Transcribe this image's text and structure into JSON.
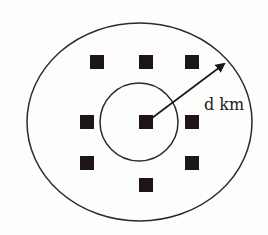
{
  "diagram": {
    "outer_region": {
      "shape": "ellipse",
      "cx": 139.5,
      "cy": 122,
      "rx": 112.5,
      "ry": 99,
      "stroke": "#2a2a2a"
    },
    "inner_region": {
      "shape": "circle",
      "cx": 139,
      "cy": 122,
      "r": 39,
      "stroke": "#2a2a2a"
    },
    "nodes": [
      {
        "id": "top-left",
        "x": 97,
        "y": 62
      },
      {
        "id": "top-center",
        "x": 146,
        "y": 62
      },
      {
        "id": "top-right",
        "x": 192,
        "y": 62
      },
      {
        "id": "middle-left",
        "x": 87,
        "y": 122
      },
      {
        "id": "center",
        "x": 146,
        "y": 122
      },
      {
        "id": "middle-right",
        "x": 192,
        "y": 122
      },
      {
        "id": "lower-left",
        "x": 87,
        "y": 163
      },
      {
        "id": "lower-right",
        "x": 192,
        "y": 163
      },
      {
        "id": "bottom-center",
        "x": 146,
        "y": 185
      }
    ],
    "node_size": 14,
    "node_color": "#1e1616",
    "radius_arrow": {
      "from": [
        152,
        118
      ],
      "to": [
        226,
        63
      ],
      "color": "#1e1616"
    },
    "radius_label": "d km"
  }
}
